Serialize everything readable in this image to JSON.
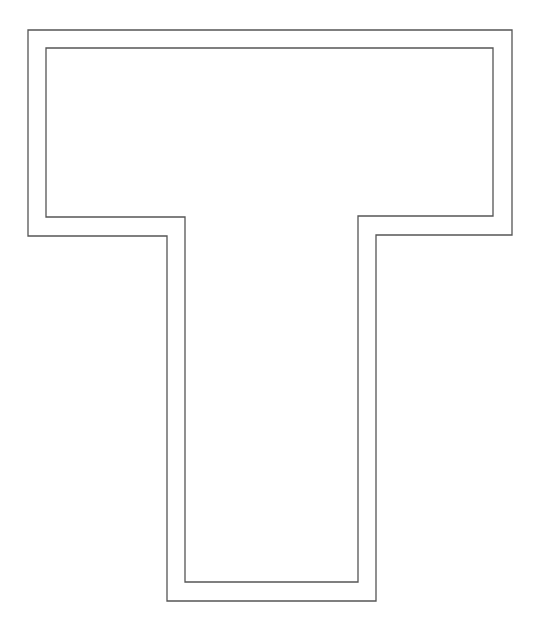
{
  "figure": {
    "stroke_color": "#555555",
    "background": "#ffffff",
    "outer_outline": "28,30 512,30 512,235 376,235 376,601 167,601 167,236 28,236",
    "inner_outline": "46,48 493,48 493,216 358,216 358,582 185,582 185,217 46,217"
  }
}
